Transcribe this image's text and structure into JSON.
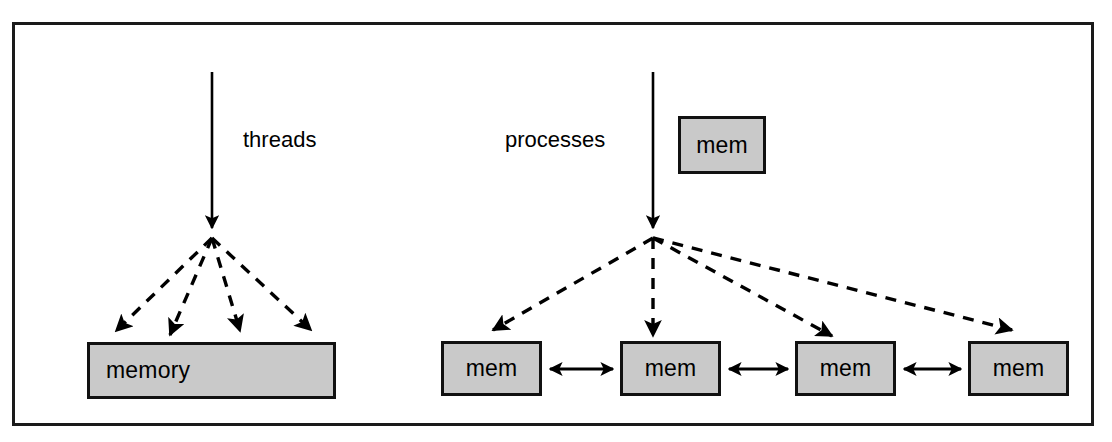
{
  "figure": {
    "background": "#ffffff",
    "border_color": "#1a1a1a",
    "box_fill": "#c9c9c9",
    "box_border": "#111111",
    "line_color": "#000000"
  },
  "labels": {
    "threads": "threads",
    "processes": "processes"
  },
  "boxes": {
    "shared_memory": "memory",
    "mem_top": "mem",
    "mem_1": "mem",
    "mem_2": "mem",
    "mem_3": "mem",
    "mem_4": "mem"
  },
  "arrows": {
    "threads_trunk": "solid-down-arrow",
    "processes_trunk": "solid-down-arrow",
    "threads_fan": "four-dashed-arrows-to-shared-memory",
    "processes_fan": "four-dashed-arrows-to-separate-memories",
    "mem_links": "double-headed-arrows-between-mem-boxes"
  }
}
